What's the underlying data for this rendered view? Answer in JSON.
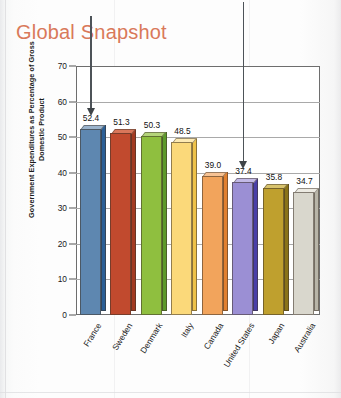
{
  "title": "Global Snapshot",
  "colors": {
    "title": "#d9795a",
    "axis": "#6e6e6e",
    "grid": "#a9a9a9",
    "arrow": "#4d5358",
    "plot_background": "#ffffff"
  },
  "chart_data": {
    "type": "bar",
    "title": "Global Snapshot",
    "xlabel": "",
    "ylabel": "Government Expenditures as Percentage of Gross Domestic Product",
    "ylim": [
      0,
      70
    ],
    "yticks": [
      0,
      10,
      20,
      30,
      40,
      50,
      60,
      70
    ],
    "ytick_labels": [
      "0",
      "10",
      "20",
      "30",
      "40",
      "50",
      "60",
      "70"
    ],
    "grid": true,
    "legend": "none",
    "categories": [
      "France",
      "Sweden",
      "Denmark",
      "Italy",
      "Canada",
      "United States",
      "Japan",
      "Australia"
    ],
    "values": [
      52.4,
      51.3,
      50.3,
      48.5,
      39.0,
      37.4,
      35.8,
      34.7
    ],
    "value_labels": [
      "52.4",
      "51.3",
      "50.3",
      "48.5",
      "39.0",
      "37.4",
      "35.8",
      "34.7"
    ],
    "bar_colors": [
      "#5e87b0",
      "#c14a2e",
      "#8fbf3f",
      "#fbd97a",
      "#f2a45c",
      "#9b8fd4",
      "#bfa02e",
      "#d9d7cd"
    ],
    "bar_side_colors": [
      "#2b5f96",
      "#a33a22",
      "#5d9a2c",
      "#eec24a",
      "#e08030",
      "#4a3fa8",
      "#8a7318",
      "#b8b5a8"
    ],
    "bar_top_colors": [
      "#9ab3cc",
      "#d9765a",
      "#b4d47a",
      "#fdeab3",
      "#f7c293",
      "#c2b9e6",
      "#d8c36d",
      "#eceae2"
    ],
    "annotations": [
      {
        "label": "arrow-france",
        "category": "France",
        "note": "down arrow above France bar"
      },
      {
        "label": "arrow-united-states",
        "category": "United States",
        "note": "down arrow above United States bar"
      }
    ]
  }
}
